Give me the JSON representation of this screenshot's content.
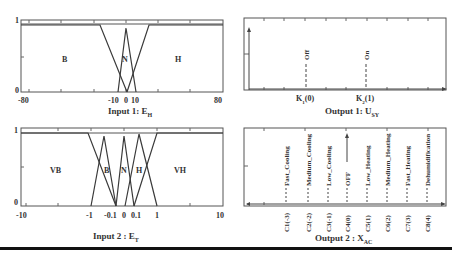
{
  "panels": {
    "input1": {
      "title": "Input 1: E",
      "title_sub": "H",
      "y_ticks": [
        "1",
        "0"
      ],
      "x_ticks": [
        "-80",
        "-10",
        "0",
        "10",
        "80"
      ],
      "sets": [
        "B",
        "N",
        "H"
      ]
    },
    "output1": {
      "title": "Output 1: U",
      "title_sub": "SY",
      "singletons": [
        {
          "label": "Off",
          "tick": "K",
          "tick_sub": "1",
          "tick_arg": "(0)"
        },
        {
          "label": "On",
          "tick": "K",
          "tick_sub": "2",
          "tick_arg": "(1)"
        }
      ]
    },
    "input2": {
      "title": "Input 2 : E",
      "title_sub": "T",
      "y_ticks": [
        "1",
        "0"
      ],
      "x_ticks": [
        "-10",
        "-1",
        "-0.1",
        "0",
        "0.1",
        "1",
        "10"
      ],
      "sets": [
        "VB",
        "B",
        "N",
        "H",
        "VH"
      ]
    },
    "output2": {
      "title": "Output 2 : X",
      "title_sub": "AC",
      "singletons": [
        {
          "label": "Fast_Cooling",
          "tick": "C1(-3)"
        },
        {
          "label": "Medium_Cooling",
          "tick": "C2(-2)"
        },
        {
          "label": "Low_Cooling",
          "tick": "C3(-1)"
        },
        {
          "label": "OFF",
          "tick": "C4(0)"
        },
        {
          "label": "Low_Heating",
          "tick": "C5(1)"
        },
        {
          "label": "Medium_Heating",
          "tick": "C6(2)"
        },
        {
          "label": "Fast_Heating",
          "tick": "C7(3)"
        },
        {
          "label": "Dehumidification",
          "tick": "C8(4)"
        }
      ]
    }
  },
  "colors": {
    "line": "#3a3a3a",
    "frame": "#555555",
    "rule": "#111111"
  }
}
